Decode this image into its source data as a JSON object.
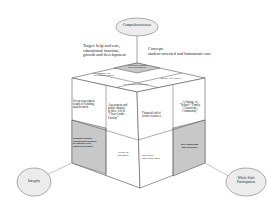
{
  "diagram": {
    "top_node": "Comprehensiveness",
    "left_node": "Integrity",
    "right_node": "Whole-Staff Participation",
    "target_text": [
      "Target: help and care,",
      "educational function,",
      "growth and development"
    ],
    "concept_text": [
      "Concept:",
      "student-oriented and humanistic care"
    ],
    "top_face": {
      "back": [
        "Encourage students'",
        "initial to humanities"
      ],
      "left": [
        "emphasize the",
        "cultivation of integrity"
      ],
      "right": [
        "improve their capacity"
      ],
      "front": [
        "develop social/mental state"
      ]
    },
    "left_face": {
      "top_left": [
        "Set up assessment",
        "teams of Funding",
        "qualification"
      ],
      "top_right": [
        "Assessment and",
        "public display",
        "at three levels:",
        "\"Class-Grade-",
        "Faculty\""
      ],
      "bottom_left": [
        "Regularly update",
        "information database",
        "of students with",
        "financial difficulty"
      ],
      "bottom_right": [
        "Follow up",
        "assessment"
      ]
    },
    "right_face": {
      "top_left": [
        "Financial aid of",
        "social resources"
      ],
      "top_right": [
        "A linkage of",
        "\"School - Family",
        "- Classroom -",
        "Community\""
      ],
      "bottom_left": [
        "addition of",
        "work-study posts"
      ],
      "bottom_right": [
        "peer counseling",
        "and assistance"
      ]
    },
    "colors": {
      "shaded": "#c8c8c8",
      "ellipse_fill": "#ececec",
      "stroke": "#666666"
    }
  }
}
